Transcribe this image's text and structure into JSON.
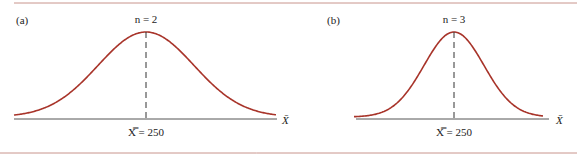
{
  "chart_data": [
    {
      "type": "line",
      "panel": "(a)",
      "title": "n = 2",
      "xlabel": "X̄",
      "annotation": "X̿ = 250",
      "center": 250,
      "description": "Normal sampling distribution of sample mean, wider spread",
      "grid": false
    },
    {
      "type": "line",
      "panel": "(b)",
      "title": "n = 3",
      "xlabel": "X̄",
      "annotation": "X̿ = 250",
      "center": 250,
      "description": "Normal sampling distribution of sample mean, narrower spread",
      "grid": false
    }
  ],
  "panels": {
    "a": {
      "label": "(a)",
      "n_label": "n = 2",
      "axis_label": "X̄",
      "mean_label": "X̿ = 250"
    },
    "b": {
      "label": "(b)",
      "n_label": "n = 3",
      "axis_label": "X̄",
      "mean_label": "X̿ = 250"
    }
  },
  "colors": {
    "rule": "#c8948c",
    "curve": "#a8342a",
    "axis": "#555555"
  }
}
